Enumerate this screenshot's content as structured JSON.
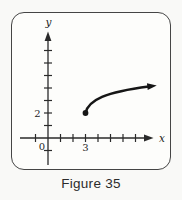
{
  "caption": "Figure 35",
  "labels": {
    "y_axis": "y",
    "x_axis": "x",
    "origin": "0",
    "y_tick_label": "2",
    "x_tick_label": "3"
  },
  "colors": {
    "ink": "#161616",
    "frame_border": "#454545",
    "background": "#f9f9f7"
  },
  "chart_data": {
    "type": "line",
    "title": "Figure 35",
    "xlabel": "x",
    "ylabel": "y",
    "grid": false,
    "x_axis": {
      "tick_values": [
        -1,
        1,
        2,
        3,
        4,
        5,
        6,
        7
      ],
      "labeled_ticks": [
        {
          "value": 3,
          "label": "3"
        }
      ],
      "arrow": true
    },
    "y_axis": {
      "tick_values": [
        -1,
        1,
        2,
        3,
        4,
        5,
        6,
        7
      ],
      "labeled_ticks": [
        {
          "value": 2,
          "label": "2"
        }
      ],
      "arrow": true
    },
    "origin_label": "0",
    "series": [
      {
        "name": "curve",
        "description": "Increasing, concave-down curve beginning at a closed (filled) endpoint at (3, 2) and continuing up and to the right, ending in an arrowhead",
        "start_point": [
          3,
          2
        ],
        "end_point": [
          8.7,
          4.2
        ],
        "start_marker": "filled-dot",
        "end_marker": "arrow"
      }
    ]
  }
}
